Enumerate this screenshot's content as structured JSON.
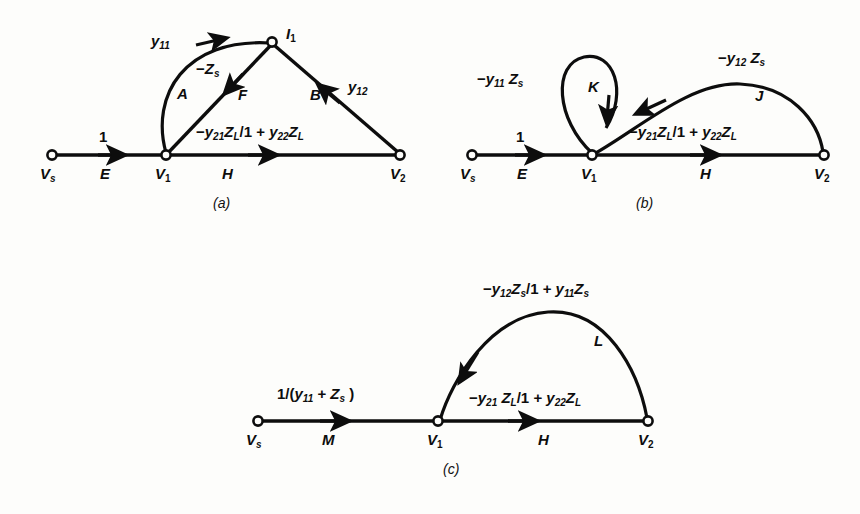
{
  "figure": {
    "type": "signal-flow-graph",
    "background_color": "#fdfdfb",
    "ink_color": "#0d0d0d",
    "panel_captions": [
      "(a)",
      "(b)",
      "(c)"
    ]
  },
  "panel_a": {
    "caption": "(a)",
    "nodes": [
      {
        "id": "Vs",
        "label": "V",
        "sub": "s",
        "x": 52,
        "y": 155
      },
      {
        "id": "V1",
        "label": "V",
        "sub": "1",
        "x": 166,
        "y": 155
      },
      {
        "id": "V2",
        "label": "V",
        "sub": "2",
        "x": 400,
        "y": 155
      },
      {
        "id": "I1",
        "label": "I",
        "sub": "1",
        "x": 272,
        "y": 42
      }
    ],
    "branches": [
      {
        "name": "E",
        "from": "Vs",
        "to": "V1",
        "gain": "1",
        "letter": "E",
        "shape": "straight"
      },
      {
        "name": "A",
        "from": "V1",
        "to": "I1",
        "gain": "y11",
        "letter": "A",
        "shape": "arc"
      },
      {
        "name": "F",
        "from": "I1",
        "to": "V1",
        "gain": "-Zs",
        "letter": "F",
        "shape": "straight"
      },
      {
        "name": "B",
        "from": "V2",
        "to": "I1",
        "gain": "y12",
        "letter": "B",
        "shape": "straight"
      },
      {
        "name": "H",
        "from": "V1",
        "to": "V2",
        "gain": "-y21ZL/1+y22ZL",
        "letter": "H",
        "shape": "straight"
      }
    ],
    "gain_labels": {
      "E": "1",
      "A": "y11",
      "F": "−Z s",
      "B": "y12",
      "H": "−y21 Z L /1 + y22 Z L"
    },
    "branch_letters": {
      "E": "E",
      "A": "A",
      "F": "F",
      "B": "B",
      "H": "H"
    }
  },
  "panel_b": {
    "caption": "(b)",
    "nodes": [
      {
        "id": "Vs",
        "label": "V",
        "sub": "s",
        "x": 472,
        "y": 155
      },
      {
        "id": "V1",
        "label": "V",
        "sub": "1",
        "x": 592,
        "y": 155
      },
      {
        "id": "V2",
        "label": "V",
        "sub": "2",
        "x": 824,
        "y": 155
      }
    ],
    "branches": [
      {
        "name": "E",
        "from": "Vs",
        "to": "V1",
        "gain": "1",
        "letter": "E",
        "shape": "straight"
      },
      {
        "name": "K",
        "from": "V1",
        "to": "V1",
        "gain": "-y11Zs",
        "letter": "K",
        "shape": "self-loop"
      },
      {
        "name": "J",
        "from": "V2",
        "to": "V1",
        "gain": "-y12Zs",
        "letter": "J",
        "shape": "arc"
      },
      {
        "name": "H",
        "from": "V1",
        "to": "V2",
        "gain": "-y21ZL/1+y22ZL",
        "letter": "H",
        "shape": "straight"
      }
    ],
    "gain_labels": {
      "E": "1",
      "K": "−y11 Z s",
      "J": "−y12 Z s",
      "H": "−y21 Z L /1 + y22 Z L"
    },
    "branch_letters": {
      "E": "E",
      "K": "K",
      "J": "J",
      "H": "H"
    }
  },
  "panel_c": {
    "caption": "(c)",
    "nodes": [
      {
        "id": "Vs",
        "label": "V",
        "sub": "s",
        "x": 258,
        "y": 421
      },
      {
        "id": "V1",
        "label": "V",
        "sub": "1",
        "x": 438,
        "y": 421
      },
      {
        "id": "V2",
        "label": "V",
        "sub": "2",
        "x": 648,
        "y": 421
      }
    ],
    "branches": [
      {
        "name": "M",
        "from": "Vs",
        "to": "V1",
        "gain": "1/(y11+Zs)",
        "letter": "M",
        "shape": "straight"
      },
      {
        "name": "L",
        "from": "V2",
        "to": "V1",
        "gain": "-y12Zs/1+y11Zs",
        "letter": "L",
        "shape": "arc"
      },
      {
        "name": "H",
        "from": "V1",
        "to": "V2",
        "gain": "-y21ZL/1+y22ZL",
        "letter": "H",
        "shape": "straight"
      }
    ],
    "gain_labels": {
      "M": "1/(y11 + Z s )",
      "L": "−y12 Z s /1 + y11 Z s",
      "H": "−y21 Z L /1 + y22 Z L"
    },
    "branch_letters": {
      "M": "M",
      "L": "L",
      "H": "H"
    }
  },
  "symbols": {
    "V": "V",
    "I": "I",
    "y": "y",
    "Z": "Z",
    "minus": "−",
    "plus": "+",
    "slash": "/",
    "one": "1",
    "sub_s": "s",
    "sub_L": "L",
    "sub_1": "1",
    "sub_2": "2",
    "sub_11": "11",
    "sub_12": "12",
    "sub_21": "21",
    "sub_22": "22",
    "paren_open": "(",
    "paren_close": ")"
  }
}
